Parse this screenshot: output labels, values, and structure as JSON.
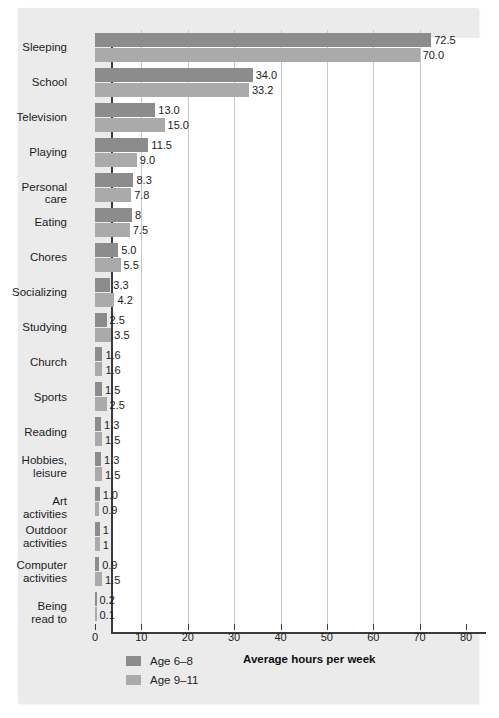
{
  "chart_data": {
    "type": "bar",
    "orientation": "horizontal",
    "title": "",
    "xlabel": "Average hours per week",
    "ylabel": "",
    "xlim": [
      0,
      80
    ],
    "xticks": [
      0,
      10,
      20,
      30,
      40,
      50,
      60,
      70,
      80
    ],
    "grid": "vertical",
    "legend_position": "bottom-left",
    "categories": [
      "Sleeping",
      "School",
      "Television",
      "Playing",
      "Personal care",
      "Eating",
      "Chores",
      "Socializing",
      "Studying",
      "Church",
      "Sports",
      "Reading",
      "Hobbies,\nleisure",
      "Art activities",
      "Outdoor\nactivities",
      "Computer\nactivities",
      "Being read to"
    ],
    "series": [
      {
        "name": "Age 6–8",
        "color": "#8c8c8c",
        "values": [
          72.5,
          34.0,
          13.0,
          11.5,
          8.3,
          8,
          5.0,
          3.3,
          2.5,
          1.6,
          1.5,
          1.3,
          1.3,
          1.0,
          1,
          0.9,
          0.2
        ],
        "labels": [
          "72.5",
          "34.0",
          "13.0",
          "11.5",
          "8.3",
          "8",
          "5.0",
          "3.3",
          "2.5",
          "1.6",
          "1.5",
          "1.3",
          "1.3",
          "1.0",
          "1",
          "0.9",
          "0.2"
        ]
      },
      {
        "name": "Age 9–11",
        "color": "#aaaaaa",
        "values": [
          70.0,
          33.2,
          15.0,
          9.0,
          7.8,
          7.5,
          5.5,
          4.2,
          3.5,
          1.6,
          2.5,
          1.5,
          1.5,
          0.9,
          1,
          1.5,
          0.1
        ],
        "labels": [
          "70.0",
          "33.2",
          "15.0",
          "9.0",
          "7.8",
          "7.5",
          "5.5",
          "4.2",
          "3.5",
          "1.6",
          "2.5",
          "1.5",
          "1.5",
          "0.9",
          "1",
          "1.5",
          "0.1"
        ]
      }
    ]
  },
  "legend": {
    "items": [
      {
        "label": "Age 6–8",
        "color": "#8c8c8c"
      },
      {
        "label": "Age 9–11",
        "color": "#aaaaaa"
      }
    ]
  },
  "axis": {
    "x_title": "Average hours per week",
    "tick_labels": [
      "0",
      "10",
      "20",
      "30",
      "40",
      "50",
      "60",
      "70",
      "80"
    ]
  },
  "colors": {
    "page_background": "#ffffff",
    "panel_background": "#ebebeb",
    "plot_background": "#ffffff",
    "gridline": "#c9c9c9",
    "axis": "#3b3b3b",
    "text": "#1c1c1c",
    "series_age_6_8": "#8c8c8c",
    "series_age_9_11": "#aaaaaa"
  }
}
